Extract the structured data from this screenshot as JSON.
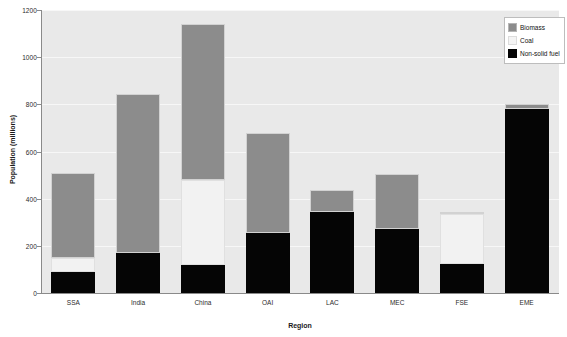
{
  "chart_data": {
    "type": "bar",
    "stacked": true,
    "title": "",
    "xlabel": "Region",
    "ylabel": "Population (millions)",
    "ylim": [
      0,
      1200
    ],
    "ytick_values": [
      0,
      200,
      400,
      600,
      800,
      1000,
      1200
    ],
    "ytick_labels": [
      "0",
      "200",
      "400",
      "600",
      "800",
      "1000",
      "1200"
    ],
    "grid": true,
    "legend_position": "top-right",
    "categories": [
      "SSA",
      "India",
      "China",
      "OAI",
      "LAC",
      "MEC",
      "FSE",
      "EME"
    ],
    "series": [
      {
        "name": "Non-solid fuel",
        "color": "#050505",
        "values": [
          90,
          170,
          120,
          255,
          345,
          270,
          125,
          780
        ]
      },
      {
        "name": "Coal",
        "color": "#f2f2f2",
        "values": [
          60,
          0,
          360,
          0,
          0,
          0,
          210,
          0
        ]
      },
      {
        "name": "Biomass",
        "color": "#8c8c8c",
        "values": [
          360,
          675,
          660,
          425,
          90,
          235,
          10,
          20
        ]
      }
    ],
    "totals": [
      510,
      845,
      1140,
      680,
      435,
      505,
      345,
      800
    ],
    "colors": {
      "biomass": "#8c8c8c",
      "coal": "#f2f2f2",
      "nonsolid": "#050505",
      "plot_background": "#e9e9e9",
      "gridline": "#f7f7f7",
      "axis": "#8a8a8a"
    }
  },
  "legend": {
    "items": [
      {
        "label": "Biomass",
        "swatch": "biomass-swatch"
      },
      {
        "label": "Coal",
        "swatch": "coal-swatch"
      },
      {
        "label": "Non-solid fuel",
        "swatch": "non-solid-fuel-swatch"
      }
    ]
  },
  "axes": {
    "x_title": "Region",
    "y_title": "Population (millions)"
  }
}
